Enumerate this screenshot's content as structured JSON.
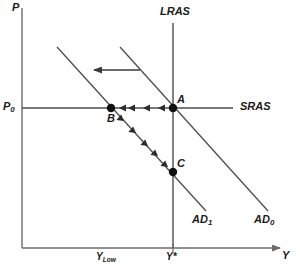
{
  "figure": {
    "background": "#ffffff",
    "line_color": "#4d4d4d",
    "axis_color": "#6b6b6b",
    "point_color": "#111111",
    "text_color": "#1a1a1a"
  },
  "axes": {
    "y_label": "P",
    "x_label": "Y",
    "origin": {
      "x": 22,
      "y": 248
    },
    "x_end": {
      "x": 285,
      "y": 248
    },
    "y_top": {
      "x": 22,
      "y": 8
    }
  },
  "ticks": [
    {
      "name": "y-low",
      "label_main": "Y",
      "label_sub": "Low",
      "x": 111
    },
    {
      "name": "y-star",
      "label_main": "Y",
      "label_sub": "*",
      "x": 173
    }
  ],
  "price_levels": [
    {
      "name": "p0",
      "label_main": "P",
      "label_sub": "0",
      "y": 108
    }
  ],
  "curves": [
    {
      "name": "lras",
      "label": "LRAS",
      "type": "vertical",
      "x": 173,
      "y1": 23,
      "y2": 248
    },
    {
      "name": "sras",
      "label": "SRAS",
      "type": "horizontal",
      "y": 108,
      "x1": 22,
      "x2": 233
    },
    {
      "name": "ad1",
      "label_main": "AD",
      "label_sub": "1",
      "type": "downward",
      "x1": 57,
      "y1": 47,
      "x2": 206,
      "y2": 211
    },
    {
      "name": "ad0",
      "label_main": "AD",
      "label_sub": "0",
      "type": "downward",
      "x1": 120,
      "y1": 47,
      "x2": 268,
      "y2": 211
    }
  ],
  "points": [
    {
      "name": "point-a",
      "label": "A",
      "x": 173,
      "y": 108,
      "desc": "initial equilibrium on LRAS, SRAS and AD0"
    },
    {
      "name": "point-b",
      "label": "B",
      "x": 111,
      "y": 108,
      "desc": "short-run equilibrium on SRAS and AD1"
    },
    {
      "name": "point-c",
      "label": "C",
      "x": 173,
      "y": 172,
      "desc": "new long-run equilibrium on LRAS and AD1"
    }
  ],
  "arrows": [
    {
      "name": "ad-shift-arrow",
      "direction": "left",
      "from_x": 140,
      "to_x": 92,
      "y": 70
    },
    {
      "name": "a-to-b-path",
      "direction": "left",
      "from_x": 173,
      "to_x": 111,
      "y": 108,
      "heads": 4
    },
    {
      "name": "b-to-c-path",
      "direction": "down-right",
      "from_x": 111,
      "from_y": 108,
      "to_x": 173,
      "to_y": 172,
      "heads": 5
    }
  ]
}
